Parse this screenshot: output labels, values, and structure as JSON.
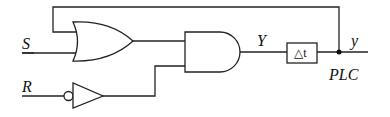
{
  "diagram": {
    "type": "logic-circuit",
    "inputs": {
      "set": {
        "label": "S"
      },
      "reset": {
        "label": "R"
      }
    },
    "signals": {
      "gate_output": {
        "label": "Y"
      },
      "output": {
        "label": "y"
      }
    },
    "delay_block": {
      "label": "△t"
    },
    "annotation": {
      "label": "PLC"
    },
    "gates": [
      {
        "id": "or1",
        "kind": "OR",
        "inputs": [
          "y (feedback)",
          "S"
        ]
      },
      {
        "id": "not1",
        "kind": "NOT",
        "inputs": [
          "R"
        ]
      },
      {
        "id": "and1",
        "kind": "AND",
        "inputs": [
          "or1",
          "not1"
        ]
      },
      {
        "id": "delay1",
        "kind": "DELAY",
        "inputs": [
          "and1"
        ]
      }
    ],
    "colors": {
      "line": "#222222",
      "background": "#ffffff"
    }
  }
}
